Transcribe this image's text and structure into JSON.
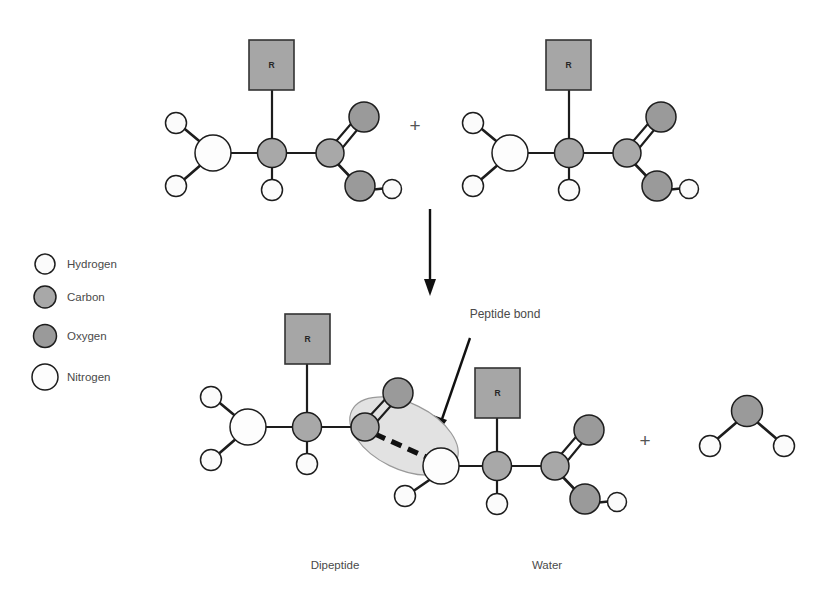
{
  "figure": {
    "background_color": "#ffffff"
  },
  "colors": {
    "hydrogen_fill": "#fbfbfb",
    "carbon_fill": "#a8a8a8",
    "oxygen_fill": "#9a9a9a",
    "nitrogen_fill": "#fdfdfd",
    "atom_stroke": "#1d1d1d",
    "r_group_fill": "#a6a6a6",
    "r_group_stroke": "#333333",
    "highlight_fill": "#e2e2e2",
    "bond_color": "#1d1d1d",
    "text_color": "#4a4a4a"
  },
  "legend": {
    "items": [
      {
        "label": "Hydrogen",
        "color": "#fbfbfb",
        "radius": 10
      },
      {
        "label": "Carbon",
        "color": "#a8a8a8",
        "radius": 11
      },
      {
        "label": "Oxygen",
        "color": "#9a9a9a",
        "radius": 11.5
      },
      {
        "label": "Nitrogen",
        "color": "#fdfdfd",
        "radius": 13
      }
    ]
  },
  "reactants": {
    "plus_symbol": "+",
    "amino_acid_1": {
      "r_group_label": "R"
    },
    "amino_acid_2": {
      "r_group_label": "R"
    }
  },
  "reaction_arrow": {
    "direction": "down"
  },
  "annotation": {
    "peptide_bond_label": "Peptide bond"
  },
  "products": {
    "plus_symbol": "+",
    "dipeptide": {
      "caption": "Dipeptide",
      "r_group_label_left": "R",
      "r_group_label_right": "R"
    },
    "water": {
      "caption": "Water"
    }
  }
}
